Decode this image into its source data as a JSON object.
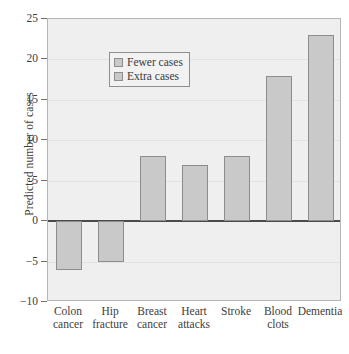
{
  "chart_data": {
    "type": "bar",
    "title": "",
    "xlabel": "",
    "ylabel": "Predicted number of cases",
    "ylim": [
      -10,
      25
    ],
    "ytick_values": [
      25,
      20,
      15,
      10,
      5,
      0,
      -5,
      -10
    ],
    "ytick_labels": [
      "25",
      "20",
      "15",
      "10",
      "5",
      "0",
      "−5",
      "−10"
    ],
    "grid": true,
    "grid_axis": "y",
    "legend_position": "upper left",
    "categories": [
      "Colon cancer",
      "Hip fracture",
      "Breast cancer",
      "Heart attacks",
      "Stroke",
      "Blood clots",
      "Dementia"
    ],
    "category_lines": [
      [
        "Colon",
        "cancer"
      ],
      [
        "Hip",
        "fracture"
      ],
      [
        "Breast",
        "cancer"
      ],
      [
        "Heart",
        "attacks"
      ],
      [
        "Stroke",
        ""
      ],
      [
        "Blood",
        "clots"
      ],
      [
        "Dementia",
        ""
      ]
    ],
    "values": [
      -6,
      -5,
      8,
      7,
      8,
      18,
      23
    ],
    "legend": [
      {
        "label": "Fewer cases",
        "color": "#c9c9c9"
      },
      {
        "label": "Extra cases",
        "color": "#c9c9c9"
      }
    ],
    "series": [
      {
        "name": "Predicted number of cases",
        "values": [
          -6,
          -5,
          8,
          7,
          8,
          18,
          23
        ]
      }
    ]
  },
  "colors": {
    "bar_fill": "#c9c9c9",
    "bar_edge": "#8d8d8d",
    "plot_background": "#efefef",
    "frame": "#b6b6b6",
    "gridline": "#e2e2e2",
    "zeroline": "#4a4a4a",
    "text": "#3a3a3a",
    "page_background": "#ffffff"
  }
}
